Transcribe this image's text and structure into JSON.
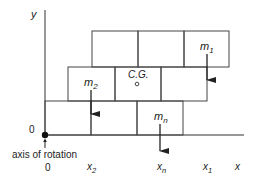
{
  "diagram": {
    "axes": {
      "y_label": "y",
      "x_label": "x",
      "origin_y_label": "0",
      "origin_x_label": "0",
      "axis_note": "axis of rotation"
    },
    "masses": [
      {
        "id": "m1",
        "base": "m",
        "sub": "1",
        "x_label_base": "x",
        "x_label_sub": "1"
      },
      {
        "id": "m2",
        "base": "m",
        "sub": "2",
        "x_label_base": "x",
        "x_label_sub": "2"
      },
      {
        "id": "mn",
        "base": "m",
        "sub": "n",
        "x_label_base": "x",
        "x_label_sub": "n"
      }
    ],
    "center_of_gravity": "C.G.",
    "rows": [
      {
        "name": "top-row",
        "blocks": 3
      },
      {
        "name": "middle-row",
        "blocks": 3
      },
      {
        "name": "bottom-row",
        "blocks": 3
      }
    ],
    "colors": {
      "line": "#333333",
      "background": "#ffffff"
    }
  }
}
